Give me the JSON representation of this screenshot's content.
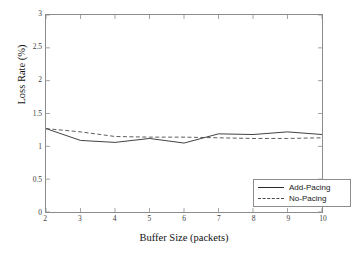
{
  "chart_data": {
    "type": "line",
    "title": "",
    "xlabel": "Buffer Size (packets)",
    "ylabel": "Loss Rate (%)",
    "xlim": [
      2,
      10
    ],
    "ylim": [
      0,
      3
    ],
    "xticks": [
      "2",
      "3",
      "4",
      "5",
      "6",
      "7",
      "8",
      "9",
      "10"
    ],
    "yticks": [
      "0",
      "0.5",
      "1",
      "1.5",
      "2",
      "2.5",
      "3"
    ],
    "grid": false,
    "legend_position": "lower-right",
    "x": [
      2,
      3,
      4,
      5,
      6,
      7,
      8,
      9,
      10
    ],
    "series": [
      {
        "name": "Add-Pacing",
        "style": "solid",
        "color": "#2b2b2b",
        "values": [
          1.27,
          1.09,
          1.06,
          1.12,
          1.05,
          1.19,
          1.18,
          1.22,
          1.18
        ]
      },
      {
        "name": "No-Pacing",
        "style": "dashed",
        "color": "#4a4a4a",
        "values": [
          1.27,
          1.22,
          1.15,
          1.14,
          1.14,
          1.13,
          1.12,
          1.12,
          1.13
        ]
      }
    ]
  },
  "legend": {
    "entries": [
      {
        "label": "Add-Pacing",
        "style": "solid"
      },
      {
        "label": "No-Pacing",
        "style": "dashed"
      }
    ]
  },
  "axes": {
    "x_title": "Buffer Size (packets)",
    "y_title": "Loss Rate (%)",
    "x_tick_labels": [
      "2",
      "3",
      "4",
      "5",
      "6",
      "7",
      "8",
      "9",
      "10"
    ],
    "y_tick_labels": [
      "0",
      "0.5",
      "1",
      "1.5",
      "2",
      "2.5",
      "3"
    ]
  },
  "colors": {
    "frame": "#8c8c8c",
    "background": "#ffffff",
    "series_solid": "#2b2b2b",
    "series_dashed": "#4a4a4a"
  }
}
